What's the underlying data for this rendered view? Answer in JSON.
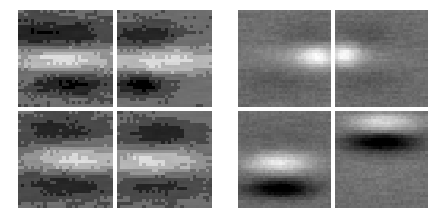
{
  "figure": {
    "title": "",
    "background_color": "#ffffff",
    "width": 443,
    "height": 219,
    "gap_color": "#ffffff"
  },
  "chart_data": {
    "type": "heatmap",
    "title": "",
    "subtitle": "",
    "xlabel": "",
    "ylabel": "",
    "grid": false,
    "legend": "none",
    "colormap": "grayscale",
    "value_range": [
      0,
      255
    ],
    "panel_layout": {
      "groups": 2,
      "rows_per_group": 2,
      "cols_per_group": 2,
      "total_tiles": 8
    },
    "groups": [
      {
        "name": "left-group",
        "x": 18,
        "y": 10,
        "width": 194,
        "height": 198,
        "tiles": [
          {
            "name": "tile-1",
            "position": "top-left",
            "grid_w": 30,
            "grid_h": 32,
            "noise": 0.085,
            "base": 0.4,
            "blobs": [
              {
                "cx": 0.52,
                "cy": 0.27,
                "sx": 0.34,
                "sy": 0.115,
                "amp": -0.3
              },
              {
                "cx": 0.5,
                "cy": 0.5,
                "sx": 0.42,
                "sy": 0.095,
                "amp": 0.47
              },
              {
                "cx": 0.55,
                "cy": 0.76,
                "sx": 0.26,
                "sy": 0.085,
                "amp": -0.38
              },
              {
                "cx": 0.12,
                "cy": 0.22,
                "sx": 0.16,
                "sy": 0.16,
                "amp": -0.14
              }
            ],
            "quantize": 7
          },
          {
            "name": "tile-2",
            "position": "top-right",
            "grid_w": 30,
            "grid_h": 32,
            "noise": 0.085,
            "base": 0.41,
            "blobs": [
              {
                "cx": 0.3,
                "cy": 0.28,
                "sx": 0.24,
                "sy": 0.1,
                "amp": -0.32
              },
              {
                "cx": 0.48,
                "cy": 0.52,
                "sx": 0.48,
                "sy": 0.095,
                "amp": 0.45
              },
              {
                "cx": 0.24,
                "cy": 0.77,
                "sx": 0.19,
                "sy": 0.075,
                "amp": -0.45
              }
            ],
            "quantize": 7
          },
          {
            "name": "tile-3",
            "position": "bottom-left",
            "grid_w": 30,
            "grid_h": 32,
            "noise": 0.085,
            "base": 0.41,
            "blobs": [
              {
                "cx": 0.42,
                "cy": 0.2,
                "sx": 0.34,
                "sy": 0.13,
                "amp": -0.26
              },
              {
                "cx": 0.62,
                "cy": 0.5,
                "sx": 0.36,
                "sy": 0.095,
                "amp": 0.46
              },
              {
                "cx": 0.48,
                "cy": 0.76,
                "sx": 0.4,
                "sy": 0.105,
                "amp": -0.3
              }
            ],
            "quantize": 7
          },
          {
            "name": "tile-4",
            "position": "bottom-right",
            "grid_w": 30,
            "grid_h": 32,
            "noise": 0.085,
            "base": 0.42,
            "blobs": [
              {
                "cx": 0.44,
                "cy": 0.24,
                "sx": 0.3,
                "sy": 0.105,
                "amp": -0.31
              },
              {
                "cx": 0.38,
                "cy": 0.52,
                "sx": 0.36,
                "sy": 0.09,
                "amp": 0.42
              },
              {
                "cx": 0.46,
                "cy": 0.78,
                "sx": 0.34,
                "sy": 0.1,
                "amp": -0.26
              }
            ],
            "quantize": 7
          }
        ]
      },
      {
        "name": "right-group",
        "x": 238,
        "y": 10,
        "width": 190,
        "height": 198,
        "tiles": [
          {
            "name": "tile-5",
            "position": "top-left",
            "grid_w": 34,
            "grid_h": 36,
            "noise": 0.055,
            "base": 0.43,
            "blobs": [
              {
                "cx": 0.86,
                "cy": 0.48,
                "sx": 0.16,
                "sy": 0.085,
                "amp": 0.5
              },
              {
                "cx": 0.55,
                "cy": 0.47,
                "sx": 0.3,
                "sy": 0.085,
                "amp": 0.12
              },
              {
                "cx": 0.8,
                "cy": 0.28,
                "sx": 0.22,
                "sy": 0.1,
                "amp": -0.1
              },
              {
                "cx": 0.45,
                "cy": 0.76,
                "sx": 0.32,
                "sy": 0.1,
                "amp": -0.08
              }
            ],
            "quantize": 0
          },
          {
            "name": "tile-6",
            "position": "top-right",
            "grid_w": 34,
            "grid_h": 36,
            "noise": 0.055,
            "base": 0.43,
            "blobs": [
              {
                "cx": 0.09,
                "cy": 0.46,
                "sx": 0.13,
                "sy": 0.085,
                "amp": 0.5
              },
              {
                "cx": 0.34,
                "cy": 0.47,
                "sx": 0.26,
                "sy": 0.08,
                "amp": 0.1
              },
              {
                "cx": 0.3,
                "cy": 0.26,
                "sx": 0.26,
                "sy": 0.11,
                "amp": -0.11
              },
              {
                "cx": 0.35,
                "cy": 0.74,
                "sx": 0.3,
                "sy": 0.1,
                "amp": -0.08
              }
            ],
            "quantize": 0
          },
          {
            "name": "tile-7",
            "position": "bottom-left",
            "grid_w": 34,
            "grid_h": 36,
            "noise": 0.055,
            "base": 0.42,
            "blobs": [
              {
                "cx": 0.45,
                "cy": 0.53,
                "sx": 0.26,
                "sy": 0.075,
                "amp": 0.5
              },
              {
                "cx": 0.46,
                "cy": 0.8,
                "sx": 0.26,
                "sy": 0.065,
                "amp": -0.5
              },
              {
                "cx": 0.48,
                "cy": 0.28,
                "sx": 0.4,
                "sy": 0.12,
                "amp": -0.05
              }
            ],
            "quantize": 0
          },
          {
            "name": "tile-8",
            "position": "bottom-right",
            "grid_w": 34,
            "grid_h": 36,
            "noise": 0.055,
            "base": 0.42,
            "blobs": [
              {
                "cx": 0.52,
                "cy": 0.12,
                "sx": 0.26,
                "sy": 0.075,
                "amp": 0.45
              },
              {
                "cx": 0.5,
                "cy": 0.32,
                "sx": 0.26,
                "sy": 0.075,
                "amp": -0.52
              },
              {
                "cx": 0.5,
                "cy": 0.62,
                "sx": 0.36,
                "sy": 0.11,
                "amp": 0.05
              }
            ],
            "quantize": 0
          }
        ]
      }
    ]
  }
}
